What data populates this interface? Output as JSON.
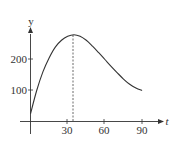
{
  "chart_data": {
    "type": "line",
    "title": "",
    "xlabel": "t",
    "ylabel": "y",
    "x_ticks": [
      30,
      60,
      90
    ],
    "y_ticks": [
      100,
      200
    ],
    "x_tick_labels": [
      "30",
      "60",
      "90"
    ],
    "y_tick_labels": [
      "100",
      "200"
    ],
    "xlim": [
      0,
      100
    ],
    "ylim": [
      0,
      300
    ],
    "grid": false,
    "series": [
      {
        "name": "y(t)",
        "x": [
          0,
          5,
          10,
          15,
          20,
          25,
          30,
          35,
          40,
          45,
          50,
          55,
          60,
          65,
          70,
          75,
          80,
          85,
          90
        ],
        "values": [
          25,
          100,
          160,
          205,
          240,
          262,
          275,
          280,
          275,
          262,
          243,
          222,
          200,
          178,
          157,
          137,
          120,
          108,
          100
        ]
      }
    ],
    "annotations": [
      {
        "type": "dashed-vertical-line",
        "x": 35,
        "from_y": 0,
        "to_y": 280,
        "label": ""
      }
    ]
  },
  "labels": {
    "y_axis": "y",
    "x_axis": "t",
    "tick_30": "30",
    "tick_60": "60",
    "tick_90": "90",
    "tick_100": "100",
    "tick_200": "200"
  }
}
